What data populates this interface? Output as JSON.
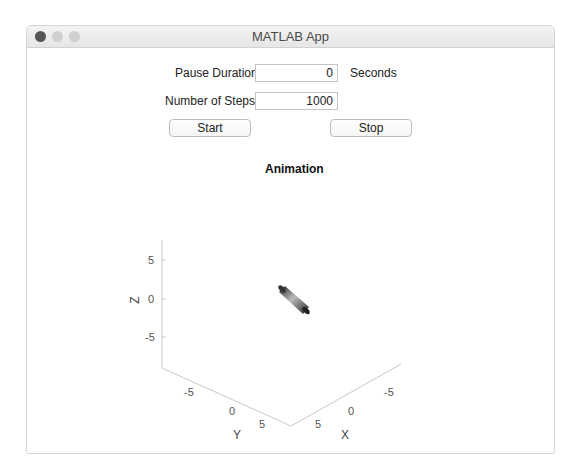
{
  "window": {
    "title": "MATLAB App",
    "traffic_lights": {
      "close_color": "#555555",
      "minimize_color": "#cfcfcf",
      "zoom_color": "#cfcfcf"
    }
  },
  "controls": {
    "pause_duration": {
      "label": "Pause Duration",
      "value": "0",
      "unit": "Seconds"
    },
    "number_of_steps": {
      "label": "Number of Steps",
      "value": "1000"
    },
    "start_button": "Start",
    "stop_button": "Stop"
  },
  "axes": {
    "title": "Animation",
    "z_label": "Z",
    "y_label": "Y",
    "x_label": "X",
    "z_ticks": [
      "5",
      "0",
      "-5"
    ],
    "y_ticks": [
      "-5",
      "0",
      "5"
    ],
    "x_ticks": [
      "-5",
      "0",
      "5"
    ],
    "object": "cylinder"
  }
}
